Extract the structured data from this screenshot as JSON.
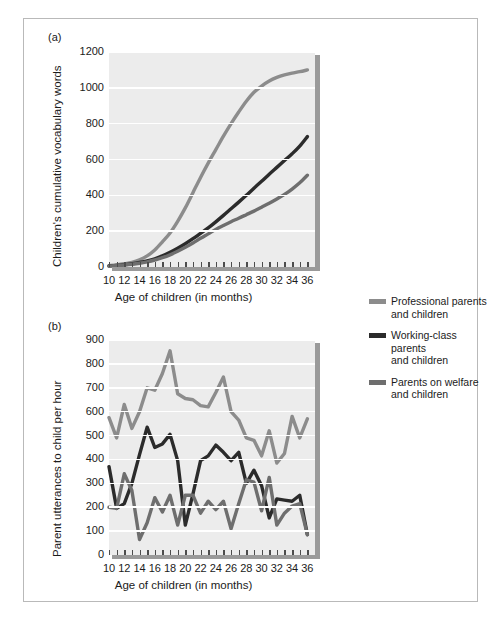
{
  "figure": {
    "panel_a_tag": "(a)",
    "panel_b_tag": "(b)"
  },
  "legend": {
    "position": "right",
    "items": [
      {
        "label_line1": "Professional parents",
        "label_line2": "and children",
        "color": "#8c8c8c",
        "key": "professional"
      },
      {
        "label_line1": "Working-class parents",
        "label_line2": "and children",
        "color": "#2b2b2b",
        "key": "working_class"
      },
      {
        "label_line1": "Parents on welfare",
        "label_line2": "and children",
        "color": "#6e6e6e",
        "key": "welfare"
      }
    ]
  },
  "colors": {
    "professional": "#8c8c8c",
    "working_class": "#2b2b2b",
    "welfare": "#6e6e6e",
    "plot_background": "#ececec",
    "grid": "#ffffff",
    "shadow": "#9a9a9a",
    "text": "#1b1b1b",
    "frame": "#b9b9b9"
  },
  "chart_data": [
    {
      "id": "panel-a",
      "type": "line",
      "title": "(a)",
      "xlabel": "Age of children (in months)",
      "ylabel": "Children's cumulative vocabulary words",
      "xlim": [
        10,
        37
      ],
      "ylim": [
        0,
        1200
      ],
      "yticks": [
        0,
        200,
        400,
        600,
        800,
        1000,
        1200
      ],
      "ytick_labels": [
        "0",
        "200",
        "400",
        "600",
        "800",
        "1000",
        "1200"
      ],
      "xticks": [
        10,
        11,
        12,
        13,
        14,
        15,
        16,
        17,
        18,
        19,
        20,
        21,
        22,
        23,
        24,
        25,
        26,
        27,
        28,
        29,
        30,
        31,
        32,
        33,
        34,
        35,
        36
      ],
      "xtick_labels": [
        "10",
        "12",
        "14",
        "16",
        "18",
        "20",
        "22",
        "24",
        "26",
        "28",
        "30",
        "32",
        "34",
        "36"
      ],
      "xtick_label_values": [
        10,
        12,
        14,
        16,
        18,
        20,
        22,
        24,
        26,
        28,
        30,
        32,
        34,
        36
      ],
      "grid": "horizontal",
      "legend": "right",
      "x": [
        10,
        11,
        12,
        13,
        14,
        15,
        16,
        17,
        18,
        19,
        20,
        21,
        22,
        23,
        24,
        25,
        26,
        27,
        28,
        29,
        30,
        31,
        32,
        33,
        34,
        35,
        36
      ],
      "series": [
        {
          "name": "Professional parents and children",
          "color": "#8c8c8c",
          "values": [
            8,
            12,
            18,
            26,
            40,
            62,
            95,
            140,
            190,
            255,
            330,
            415,
            500,
            580,
            655,
            730,
            800,
            865,
            925,
            975,
            1010,
            1038,
            1058,
            1072,
            1082,
            1090,
            1100
          ]
        },
        {
          "name": "Working-class parents and children",
          "color": "#2b2b2b",
          "values": [
            6,
            9,
            13,
            18,
            25,
            34,
            46,
            62,
            82,
            105,
            130,
            158,
            188,
            218,
            252,
            288,
            325,
            362,
            400,
            440,
            478,
            518,
            556,
            594,
            632,
            675,
            728
          ]
        },
        {
          "name": "Parents on welfare and children",
          "color": "#6e6e6e",
          "values": [
            5,
            8,
            11,
            15,
            21,
            29,
            39,
            52,
            68,
            88,
            110,
            134,
            160,
            185,
            210,
            232,
            253,
            272,
            292,
            312,
            334,
            356,
            380,
            405,
            435,
            470,
            512
          ]
        }
      ]
    },
    {
      "id": "panel-b",
      "type": "line",
      "title": "(b)",
      "xlabel": "Age of children (in months)",
      "ylabel": "Parent utterances to child per hour",
      "xlim": [
        10,
        37
      ],
      "ylim": [
        0,
        900
      ],
      "yticks": [
        0,
        100,
        200,
        300,
        400,
        500,
        600,
        700,
        800,
        900
      ],
      "ytick_labels": [
        "0",
        "100",
        "200",
        "300",
        "400",
        "500",
        "600",
        "700",
        "800",
        "900"
      ],
      "xticks": [
        10,
        11,
        12,
        13,
        14,
        15,
        16,
        17,
        18,
        19,
        20,
        21,
        22,
        23,
        24,
        25,
        26,
        27,
        28,
        29,
        30,
        31,
        32,
        33,
        34,
        35,
        36
      ],
      "xtick_labels": [
        "10",
        "12",
        "14",
        "16",
        "18",
        "20",
        "22",
        "24",
        "26",
        "28",
        "30",
        "32",
        "34",
        "36"
      ],
      "xtick_label_values": [
        10,
        12,
        14,
        16,
        18,
        20,
        22,
        24,
        26,
        28,
        30,
        32,
        34,
        36
      ],
      "grid": "horizontal",
      "legend": "right",
      "x": [
        10,
        11,
        12,
        13,
        14,
        15,
        16,
        17,
        18,
        19,
        20,
        21,
        22,
        23,
        24,
        25,
        26,
        27,
        28,
        29,
        30,
        31,
        32,
        33,
        34,
        35,
        36
      ],
      "series": [
        {
          "name": "Professional parents and children",
          "color": "#8c8c8c",
          "values": [
            575,
            490,
            630,
            530,
            600,
            700,
            690,
            760,
            855,
            675,
            655,
            650,
            625,
            620,
            680,
            745,
            600,
            565,
            490,
            480,
            415,
            520,
            385,
            425,
            580,
            490,
            570
          ]
        },
        {
          "name": "Working-class parents and children",
          "color": "#2b2b2b",
          "values": [
            370,
            195,
            215,
            300,
            420,
            535,
            450,
            465,
            505,
            395,
            125,
            255,
            395,
            415,
            460,
            430,
            395,
            430,
            300,
            355,
            290,
            155,
            235,
            230,
            225,
            250,
            85
          ]
        },
        {
          "name": "Parents on welfare and children",
          "color": "#6e6e6e",
          "values": [
            200,
            195,
            340,
            270,
            65,
            135,
            240,
            180,
            250,
            125,
            250,
            250,
            175,
            225,
            190,
            225,
            110,
            215,
            315,
            305,
            185,
            325,
            125,
            175,
            205,
            215,
            85
          ]
        }
      ]
    }
  ]
}
